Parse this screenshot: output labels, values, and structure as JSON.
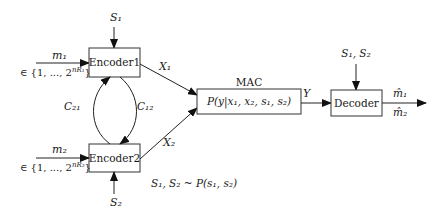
{
  "diagram": {
    "type": "block-diagram",
    "nodes": {
      "encoder1": {
        "label": "Encoder1"
      },
      "encoder2": {
        "label": "Encoder2"
      },
      "mac": {
        "label": "P(y|x₁, x₂, s₁, s₂)",
        "caption": "MAC"
      },
      "decoder": {
        "label": "Decoder"
      }
    },
    "inputs": {
      "m1": {
        "label": "m₁",
        "set": "∈ {1, ..., 2",
        "exp": "nR₁",
        "close": "}"
      },
      "m2": {
        "label": "m₂",
        "set": "∈ {1, ..., 2",
        "exp": "nR₂",
        "close": "}"
      },
      "s1": {
        "label": "S₁"
      },
      "s2": {
        "label": "S₂"
      },
      "decoder_state": {
        "label": "S₁, S₂"
      }
    },
    "edges": {
      "x1": {
        "label": "X₁"
      },
      "x2": {
        "label": "X₂"
      },
      "y": {
        "label": "Y"
      },
      "c12": {
        "label": "C₁₂"
      },
      "c21": {
        "label": "C₂₁"
      }
    },
    "outputs": {
      "m1_hat": {
        "label": "m̂₁"
      },
      "m2_hat": {
        "label": "m̂₂"
      }
    },
    "annotation": "S₁, S₂ ~ P(s₁, s₂)"
  }
}
